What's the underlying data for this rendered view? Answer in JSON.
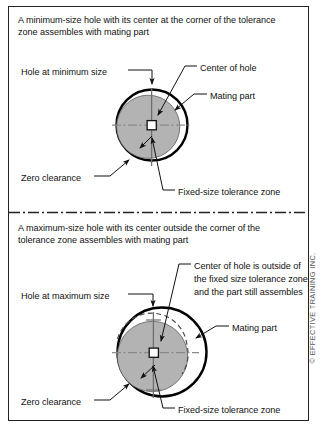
{
  "figure": {
    "title_top": "A minimum-size hole with its center at the corner of the tolerance zone assembles with mating part",
    "title_bottom": "A maximum-size hole with its center outside the corner of the tolerance zone assembles with mating part",
    "copyright": "© EFFECTIVE TRAINING INC.",
    "colors": {
      "outline": "#000000",
      "part_fill": "#b3b3b3",
      "center_line": "#7a7a7a",
      "leader": "#1a1a1a",
      "border": "#222222",
      "background": "#ffffff"
    }
  },
  "panels": [
    {
      "id": "minimum-size-hole",
      "caption": "A minimum-size hole with its center at the corner of the tolerance zone assembles with mating part",
      "labels": {
        "hole": "Hole at minimum size",
        "center_of_hole": "Center of hole",
        "mating_part": "Mating part",
        "zero_clearance": "Zero clearance",
        "tolerance_zone": "Fixed-size tolerance zone"
      },
      "geometry": {
        "hole_center": [
          152,
          125
        ],
        "hole_radius": 36,
        "part_center": [
          148,
          125
        ],
        "part_radius": 32,
        "tolerance_square": [
          146,
          124,
          9,
          9
        ]
      }
    },
    {
      "id": "maximum-size-hole",
      "caption": "A maximum-size hole with its center outside the corner of the tolerance zone assembles with mating part",
      "labels": {
        "hole": "Hole at maximum size",
        "center_of_hole": "Center of hole is outside of the fixed size tolerance zone and the part still assembles",
        "mating_part": "Mating part",
        "zero_clearance": "Zero clearance",
        "tolerance_zone": "Fixed-size tolerance zone"
      },
      "geometry": {
        "hole_center": [
          162,
          352
        ],
        "hole_radius": 45,
        "part_center": [
          152,
          355
        ],
        "part_radius": 36,
        "tolerance_square": [
          149,
          348,
          9,
          9
        ]
      }
    }
  ]
}
